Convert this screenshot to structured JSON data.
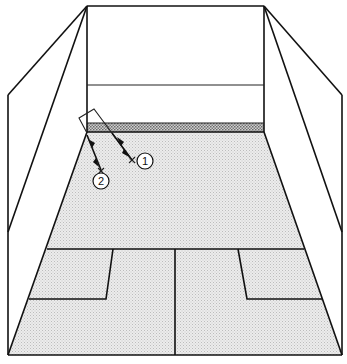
{
  "diagram": {
    "colors": {
      "line": "#111111",
      "floor": "#e8e8e8",
      "tin": "#9a9a9a",
      "background": "#ffffff"
    },
    "markers": [
      {
        "id": "marker-1",
        "label": "1"
      },
      {
        "id": "marker-2",
        "label": "2"
      }
    ]
  }
}
